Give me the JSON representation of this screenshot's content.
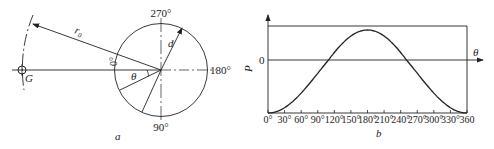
{
  "panel_a": {
    "caption": "a",
    "labels": {
      "deg270": "270°",
      "deg180": "180°",
      "deg90": "90°",
      "deg0": "0°",
      "r0": "r₀",
      "d": "d",
      "theta": "θ",
      "G": "G"
    }
  },
  "panel_b": {
    "caption": "b",
    "ylabel": "P",
    "zero_label": "0",
    "xlabel": "θ"
  },
  "chart_data": {
    "type": "line",
    "title": "",
    "xlabel": "θ",
    "ylabel": "P",
    "x_ticks": [
      "0°",
      "30°",
      "60°",
      "90°",
      "120°",
      "150°",
      "180°",
      "210°",
      "240°",
      "270°",
      "300°",
      "330°",
      "360"
    ],
    "xlim": [
      0,
      360
    ],
    "ylim": [
      -1.05,
      0.55
    ],
    "zero_crossings_deg": [
      110,
      250
    ],
    "series": [
      {
        "name": "P(θ)",
        "x": [
          0,
          30,
          60,
          90,
          120,
          150,
          180,
          210,
          240,
          270,
          300,
          330,
          360
        ],
        "y": [
          -1.0,
          -0.88,
          -0.58,
          -0.2,
          0.15,
          0.42,
          0.5,
          0.42,
          0.15,
          -0.2,
          -0.58,
          -0.88,
          -1.0
        ]
      }
    ],
    "grid": false,
    "legend": "none"
  }
}
